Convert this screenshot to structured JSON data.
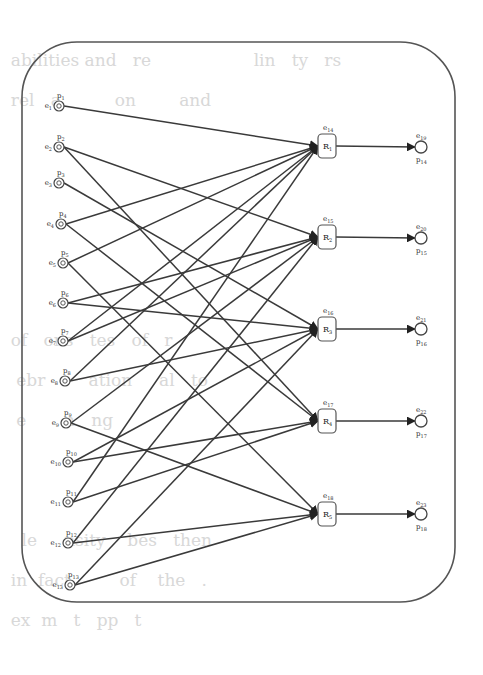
{
  "diagram": {
    "type": "bipartite-flow-network",
    "frame": {
      "shape": "rounded-rectangle",
      "x": 22,
      "y": 42,
      "width": 433,
      "height": 560,
      "radius": 55,
      "stroke": "#555555"
    },
    "background_text_lines": [
      "                                                         ",
      "  abilities and   re                   lin   ty   rs",
      "  rel   a          on        and          ",
      "",
      "",
      "",
      "",
      "",
      "  of   ons   tes   of   r",
      "   ebr        ation     al   to",
      "   e       n   ng",
      "",
      "",
      "    le     nsity    bes   then",
      "  in  fact         of    the   .",
      "  ex  m   t   pp   t"
    ],
    "input_nodes": [
      {
        "id": "e1",
        "label_e": "e1",
        "label_p": "p1",
        "x": 59,
        "y": 106
      },
      {
        "id": "e2",
        "label_e": "e2",
        "label_p": "p2",
        "x": 59,
        "y": 147
      },
      {
        "id": "e3",
        "label_e": "e3",
        "label_p": "p3",
        "x": 59,
        "y": 183
      },
      {
        "id": "e4",
        "label_e": "e4",
        "label_p": "p4",
        "x": 61,
        "y": 224
      },
      {
        "id": "e5",
        "label_e": "e5",
        "label_p": "p5",
        "x": 63,
        "y": 263
      },
      {
        "id": "e6",
        "label_e": "e6",
        "label_p": "p6",
        "x": 63,
        "y": 303
      },
      {
        "id": "e7",
        "label_e": "e7",
        "label_p": "p7",
        "x": 63,
        "y": 341
      },
      {
        "id": "e8",
        "label_e": "e8",
        "label_p": "p8",
        "x": 65,
        "y": 381
      },
      {
        "id": "e9",
        "label_e": "e9",
        "label_p": "p9",
        "x": 66,
        "y": 423
      },
      {
        "id": "e10",
        "label_e": "e10",
        "label_p": "p10",
        "x": 68,
        "y": 462
      },
      {
        "id": "e11",
        "label_e": "e11",
        "label_p": "p11",
        "x": 68,
        "y": 502
      },
      {
        "id": "e12",
        "label_e": "e12",
        "label_p": "p12",
        "x": 68,
        "y": 543
      },
      {
        "id": "e13",
        "label_e": "e13",
        "label_p": "p13",
        "x": 70,
        "y": 585
      }
    ],
    "relay_nodes": [
      {
        "id": "R1",
        "label": "R1",
        "top_label": "e14",
        "x": 327,
        "y": 146
      },
      {
        "id": "R2",
        "label": "R2",
        "top_label": "e15",
        "x": 327,
        "y": 237
      },
      {
        "id": "R3",
        "label": "R3",
        "top_label": "e16",
        "x": 327,
        "y": 329
      },
      {
        "id": "R4",
        "label": "R4",
        "top_label": "e17",
        "x": 327,
        "y": 421
      },
      {
        "id": "R5",
        "label": "R5",
        "top_label": "e18",
        "x": 327,
        "y": 514
      }
    ],
    "output_nodes": [
      {
        "id": "o1",
        "label_e": "e19",
        "label_p": "p14",
        "x": 421,
        "y": 147
      },
      {
        "id": "o2",
        "label_e": "e20",
        "label_p": "p15",
        "x": 421,
        "y": 238
      },
      {
        "id": "o3",
        "label_e": "e21",
        "label_p": "p16",
        "x": 421,
        "y": 329
      },
      {
        "id": "o4",
        "label_e": "e22",
        "label_p": "p17",
        "x": 421,
        "y": 421
      },
      {
        "id": "o5",
        "label_e": "e23",
        "label_p": "p18",
        "x": 421,
        "y": 514
      }
    ],
    "edges": [
      [
        "e1",
        "R1"
      ],
      [
        "e2",
        "R2"
      ],
      [
        "e2",
        "R4"
      ],
      [
        "e3",
        "R3"
      ],
      [
        "e4",
        "R1"
      ],
      [
        "e4",
        "R4"
      ],
      [
        "e5",
        "R1"
      ],
      [
        "e5",
        "R5"
      ],
      [
        "e6",
        "R2"
      ],
      [
        "e6",
        "R3"
      ],
      [
        "e7",
        "R1"
      ],
      [
        "e7",
        "R2"
      ],
      [
        "e8",
        "R1"
      ],
      [
        "e8",
        "R3"
      ],
      [
        "e9",
        "R2"
      ],
      [
        "e9",
        "R5"
      ],
      [
        "e10",
        "R3"
      ],
      [
        "e10",
        "R4"
      ],
      [
        "e11",
        "R1"
      ],
      [
        "e11",
        "R4"
      ],
      [
        "e12",
        "R2"
      ],
      [
        "e12",
        "R5"
      ],
      [
        "e13",
        "R3"
      ],
      [
        "e13",
        "R5"
      ],
      [
        "R1",
        "o1"
      ],
      [
        "R2",
        "o2"
      ],
      [
        "R3",
        "o3"
      ],
      [
        "R4",
        "o4"
      ],
      [
        "R5",
        "o5"
      ]
    ],
    "colors": {
      "line": "#3a3a3a",
      "node": "#444444",
      "frame": "#555555"
    }
  }
}
